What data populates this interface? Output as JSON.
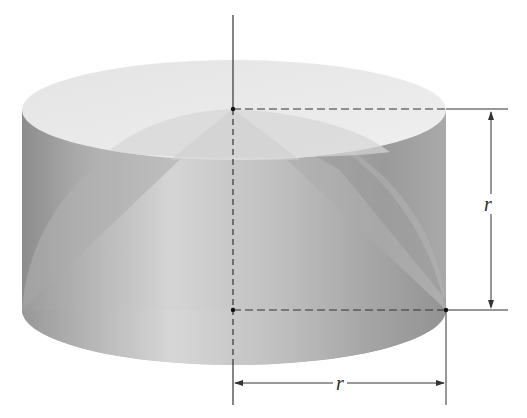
{
  "figure": {
    "labels": {
      "height_label": "r",
      "radius_label": "r"
    },
    "colors": {
      "background": "#ffffff",
      "cylinder_side_dark": "#8e8e8e",
      "cylinder_side_light": "#c8c8c8",
      "top_face": "#e8e8e8",
      "hemisphere": "#b4b4b4",
      "cone_light": "#d4d4d4",
      "cone_dark": "#9a9a9a",
      "lines": "#333333"
    }
  }
}
